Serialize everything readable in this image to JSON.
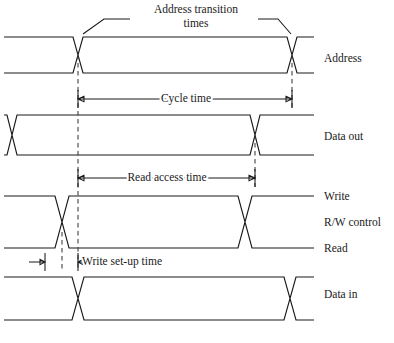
{
  "figure": {
    "kind": "memory-timing-diagram",
    "title_visible": false,
    "background_color": "#ffffff",
    "line_color": "#1a1a1a",
    "dash_color": "#3a3a3a",
    "width": 394,
    "height": 343
  },
  "signals": [
    {
      "id": "address",
      "label": "Address",
      "label_x": 324,
      "label_y": 62,
      "top_y": 37,
      "bottom_y": 73,
      "x_start": 4,
      "x_end": 314,
      "transitions": [
        {
          "x": 78,
          "slope": 10
        },
        {
          "x": 292,
          "slope": 10
        }
      ]
    },
    {
      "id": "data-out",
      "label": "Data out",
      "label_x": 324,
      "label_y": 140,
      "top_y": 115,
      "bottom_y": 155,
      "x_start": 4,
      "x_end": 314,
      "transitions": [
        {
          "x": 12,
          "slope": 10
        },
        {
          "x": 255,
          "slope": 10
        }
      ]
    },
    {
      "id": "rw-control",
      "label": "R/W control",
      "label_x": 324,
      "label_y": 226,
      "top_y": 196,
      "bottom_y": 248,
      "x_start": 4,
      "x_end": 314,
      "transitions": [
        {
          "x": 62,
          "slope": 14
        },
        {
          "x": 245,
          "slope": 14
        }
      ],
      "level_labels": [
        {
          "id": "write",
          "text": "Write",
          "x": 324,
          "y": 200
        },
        {
          "id": "read",
          "text": "Read",
          "x": 324,
          "y": 252
        }
      ]
    },
    {
      "id": "data-in",
      "label": "Data in",
      "label_x": 324,
      "label_y": 298,
      "top_y": 277,
      "bottom_y": 320,
      "x_start": 4,
      "x_end": 314,
      "transitions": [
        {
          "x": 78,
          "slope": 12
        },
        {
          "x": 290,
          "slope": 12
        }
      ]
    }
  ],
  "annotations": {
    "address_transition": {
      "id": "address-transition-times",
      "line1": "Address transition",
      "line2": "times",
      "text_x": 196,
      "text_y1": 13,
      "text_y2": 27,
      "leader_left": "M 130 19 L 104 19 L 83 34",
      "leader_right": "M 258 19 L 278 19 L 291 34"
    }
  },
  "dimensions": [
    {
      "id": "cycle-time",
      "label": "Cycle time",
      "y": 99,
      "x_left": 78,
      "x_right": 292,
      "text_x": 186,
      "text_y": 102,
      "tick_top": 90,
      "tick_bottom": 108
    },
    {
      "id": "read-access-time",
      "label": "Read access time",
      "y": 178,
      "x_left": 78,
      "x_right": 255,
      "text_x": 167,
      "text_y": 181,
      "tick_top": 169,
      "tick_bottom": 187
    },
    {
      "id": "write-set-up-time",
      "label": "Write set-up time",
      "y": 262,
      "x_left": 45,
      "x_right": 78,
      "text_x": 82,
      "text_y": 265,
      "tick_top": 253,
      "tick_bottom": 271,
      "outward_arrows": true
    }
  ],
  "guide_lines": [
    {
      "id": "guide-address-fall",
      "x": 78,
      "y_top": 55,
      "y_bottom": 271
    },
    {
      "id": "guide-write-setup",
      "x": 62,
      "y_top": 232,
      "y_bottom": 271
    },
    {
      "id": "guide-address-rise",
      "x": 292,
      "y_top": 55,
      "y_bottom": 108
    },
    {
      "id": "guide-dataout-end",
      "x": 255,
      "y_top": 135,
      "y_bottom": 187
    }
  ],
  "caption": {
    "text": "",
    "x": 4,
    "y": 340,
    "visible": false
  }
}
